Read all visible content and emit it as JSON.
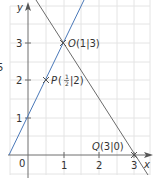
{
  "diagram": {
    "type": "coordinate-graph",
    "colors": {
      "grid": "#e4e4e4",
      "axis": "#6e6e6e",
      "line_blue": "#4a78b8",
      "line_gray": "#6b6b6b",
      "text": "#333333"
    },
    "edge_label": "5",
    "axes": {
      "x_label": "x",
      "y_label": "y",
      "origin_label": "0",
      "x_ticks": [
        "1",
        "2",
        "3"
      ],
      "y_ticks": [
        "1",
        "2",
        "3"
      ]
    },
    "lines": [
      {
        "name": "blue-line",
        "equation": "y = 2x + 1",
        "color": "#4a78b8"
      },
      {
        "name": "gray-line",
        "equation": "y = -1.5x + 4.5",
        "color": "#6b6b6b"
      }
    ],
    "points": [
      {
        "name": "O",
        "coords_label": "(1|3)",
        "x": 1,
        "y": 3
      },
      {
        "name": "P",
        "coords_label": "(½|2)",
        "x": 0.5,
        "y": 2
      },
      {
        "name": "Q",
        "coords_label": "(3|0)",
        "x": 3,
        "y": 0
      }
    ],
    "point_labels": {
      "O_letter": "O",
      "O_coords": "(1|3)",
      "P_letter": "P",
      "P_frac_num": "1",
      "P_frac_den": "2",
      "P_rest": "|2)",
      "P_open": "(",
      "Q_letter": "Q",
      "Q_coords": "(3|0)"
    }
  }
}
